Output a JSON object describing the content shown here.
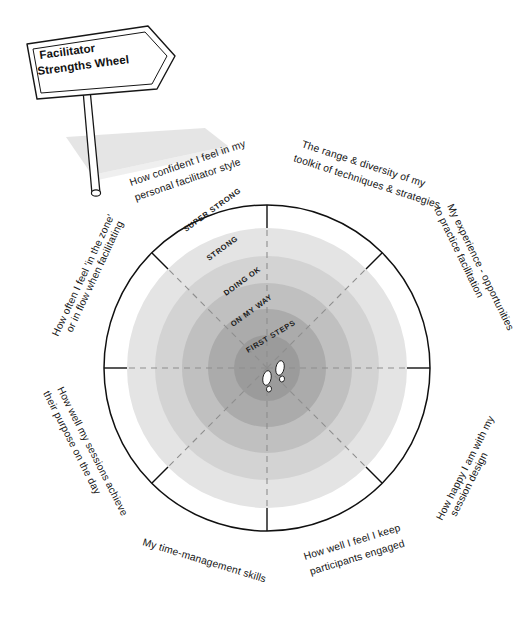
{
  "poster": {
    "title_line_1": "Facilitator",
    "title_line_2": "Strengths Wheel",
    "background_color": "#ffffff",
    "ink_color": "#111111"
  },
  "wheel": {
    "center_x": 267,
    "center_y": 368,
    "outer_radius": 163,
    "segment_count": 8,
    "ring_count": 5,
    "rings": [
      {
        "label": "SUPER STRONG",
        "level": 5,
        "radius": 140,
        "color": "#e3e3e3"
      },
      {
        "label": "STRONG",
        "level": 4,
        "radius": 112,
        "color": "#d2d2d2"
      },
      {
        "label": "DOING OK",
        "level": 3,
        "radius": 85,
        "color": "#bfbfbf"
      },
      {
        "label": "ON MY WAY",
        "level": 2,
        "radius": 59,
        "color": "#ababab"
      },
      {
        "label": "FIRST STEPS",
        "level": 1,
        "radius": 33,
        "color": "#9a9a9a"
      }
    ],
    "segments": [
      {
        "index": 0,
        "label": "How confident I feel in my personal facilitator style",
        "lines": [
          "How confident I feel in my",
          "personal facilitator style"
        ]
      },
      {
        "index": 1,
        "label": "The range & diversity of my toolkit of techniques & strategies",
        "lines": [
          "The range & diversity of my",
          "toolkit of techniques & strategies"
        ]
      },
      {
        "index": 2,
        "label": "My experience - opportunities to practice facilitation",
        "lines": [
          "My experience - opportunities",
          "to practice facilitation"
        ]
      },
      {
        "index": 3,
        "label": "How happy I am with my session design",
        "lines": [
          "How happy I am with my",
          "session design"
        ]
      },
      {
        "index": 4,
        "label": "How well I feel I keep participants engaged",
        "lines": [
          "How well I feel I keep",
          "participants engaged"
        ]
      },
      {
        "index": 5,
        "label": "My time-management skills",
        "lines": [
          "My time-management skills"
        ]
      },
      {
        "index": 6,
        "label": "How well my sessions achieve their purpose on the day",
        "lines": [
          "How well my sessions achieve",
          "their purpose on the day"
        ]
      },
      {
        "index": 7,
        "label": "How often I feel 'in the zone' or in flow when facilitating",
        "lines": [
          "How often I feel 'in the zone'",
          "or in flow when facilitating"
        ]
      }
    ],
    "center_marker": "footprints-icon"
  }
}
